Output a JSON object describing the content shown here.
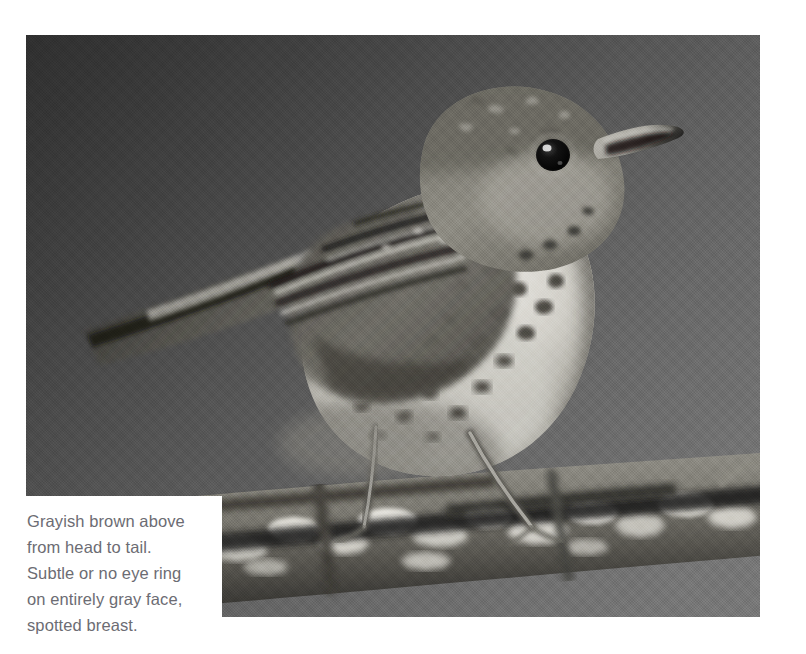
{
  "page": {
    "background_color": "#ffffff",
    "width": 806,
    "height": 654
  },
  "photo": {
    "alt_name": "gray-cheeked-thrush-photo",
    "subject": "thrush perched on lichen-covered branch",
    "treatment": "black-and-white photograph",
    "background_color_dark": "#2f2f2f",
    "background_color_light": "#787878",
    "frame": {
      "left": 26,
      "top": 35,
      "width": 734,
      "height": 582
    },
    "elements": {
      "bird_label": "perched thrush, facing right",
      "beak_label": "pale bill with dark tip",
      "eye_label": "dark eye, no eye ring",
      "breast_label": "pale breast with dark spots",
      "wing_label": "folded wing with barred flight feathers",
      "tail_label": "long tail angled down-left",
      "legs_label": "two thin pale legs",
      "branch_label": "lichen encrusted branch"
    }
  },
  "caption": {
    "panel_color": "#ffffff",
    "text_color": "#6c6c73",
    "body": "Grayish brown above\nfrom head to tail.\nSubtle or no eye ring\non entirely gray face,\nspotted breast.",
    "lines": [
      "Grayish brown above",
      "from head to tail.",
      "Subtle or no eye ring",
      "on entirely gray face,",
      "spotted breast."
    ]
  }
}
